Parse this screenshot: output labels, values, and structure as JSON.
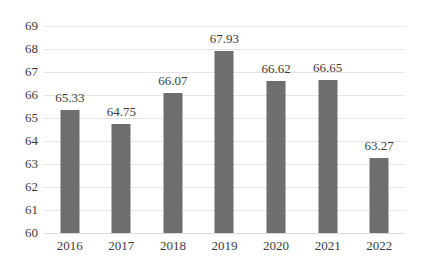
{
  "chart_data": {
    "type": "bar",
    "title": "",
    "subtitle": "",
    "xlabel": "",
    "ylabel": "",
    "categories": [
      "2016",
      "2017",
      "2018",
      "2019",
      "2020",
      "2021",
      "2022"
    ],
    "values": [
      65.33,
      64.75,
      66.07,
      67.93,
      66.62,
      66.65,
      63.27
    ],
    "data_labels": [
      "65.33",
      "64.75",
      "66.07",
      "67.93",
      "66.62",
      "66.65",
      "63.27"
    ],
    "ylim": [
      60,
      69
    ],
    "ytick_step": 1,
    "ytick_labels": [
      "69",
      "68",
      "67",
      "66",
      "65",
      "64",
      "63",
      "62",
      "61",
      "60"
    ],
    "ytick_values": [
      69,
      68,
      67,
      66,
      65,
      64,
      63,
      62,
      61,
      60
    ],
    "legend": [],
    "legend_position": "none",
    "grid": {
      "horizontal": true,
      "vertical": false,
      "color": "#E6E6E6"
    },
    "series": [
      {
        "name": "",
        "color": "#6E6E6E",
        "values": [
          65.33,
          64.75,
          66.07,
          67.93,
          66.62,
          66.65,
          63.27
        ]
      }
    ],
    "colors": {
      "bar": "#6E6E6E",
      "grid": "#E6E6E6",
      "baseline": "#DCDCDC",
      "text": "#3C3C3C",
      "background": "#FFFFFF"
    }
  }
}
